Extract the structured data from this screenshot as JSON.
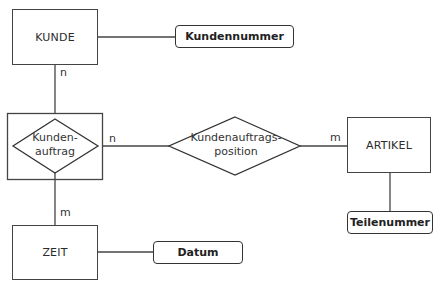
{
  "diagram": {
    "type": "entity-relationship",
    "entities": [
      {
        "id": "kunde",
        "label": "KUNDE"
      },
      {
        "id": "artikel",
        "label": "ARTIKEL"
      },
      {
        "id": "zeit",
        "label": "ZEIT"
      }
    ],
    "relationships": [
      {
        "id": "kundenauftrag",
        "label_line1": "Kunden-",
        "label_line2": "auftrag",
        "weak_entity_frame": true
      },
      {
        "id": "kundenauftragsposition",
        "label_line1": "Kundenauftrags-",
        "label_line2": "position"
      }
    ],
    "attributes": [
      {
        "id": "kundennummer",
        "label": "Kundennummer",
        "of": "kunde"
      },
      {
        "id": "teilenummer",
        "label": "Teilenummer",
        "of": "artikel"
      },
      {
        "id": "datum",
        "label": "Datum",
        "of": "zeit"
      }
    ],
    "cardinalities": {
      "kunde_to_kundenauftrag": "n",
      "kundenauftrag_to_position": "n",
      "position_to_artikel": "m",
      "kundenauftrag_to_zeit": "m"
    }
  }
}
